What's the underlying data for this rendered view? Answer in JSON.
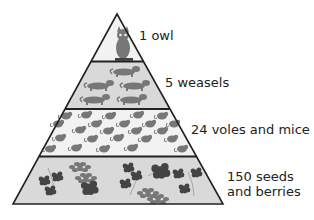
{
  "colors": {
    "tier_fill": "#d9d9d9",
    "top_fill": "#f2f2f2",
    "outline": "#222222",
    "organism": "#777777",
    "organism_dark": "#444444"
  },
  "tiers": [
    {
      "name": "owl",
      "count": 1,
      "label": "1 owl",
      "icon": "owl-icon",
      "fill_key": "top_fill"
    },
    {
      "name": "weasels",
      "count": 5,
      "label": "5 weasels",
      "icon": "weasel-icon",
      "fill_key": "tier_fill"
    },
    {
      "name": "voles-and-mice",
      "count": 24,
      "label": "24 voles and mice",
      "icon": "mouse-icon",
      "fill_key": "top_fill"
    },
    {
      "name": "seeds-and-berries",
      "count": 150,
      "label_lines": [
        "150 seeds",
        "and berries"
      ],
      "icon": "berry-icon",
      "fill_key": "tier_fill"
    }
  ]
}
